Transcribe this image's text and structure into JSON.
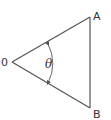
{
  "diagram": {
    "type": "angle-triangle",
    "labels": {
      "vertex_o": "0",
      "vertex_a": "A",
      "vertex_b": "B",
      "angle": "θ"
    },
    "colors": {
      "line": "#555555",
      "text": "#333333",
      "background": "#ffffff"
    }
  }
}
